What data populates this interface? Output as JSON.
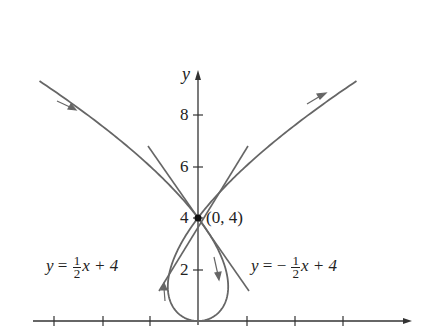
{
  "figure": {
    "axes": {
      "x_label": "",
      "y_label": "y",
      "y_ticks": [
        "2",
        "4",
        "6",
        "8"
      ],
      "x_tick_count_left": 3,
      "x_tick_count_right": 3
    },
    "point_label": "(0, 4)",
    "tangent_left": {
      "lhs": "y",
      "eq": "=",
      "num": "1",
      "den": "2",
      "rest": "x + 4"
    },
    "tangent_right": {
      "lhs": "y",
      "eq": "= −",
      "num": "1",
      "den": "2",
      "rest": "x + 4"
    },
    "colors": {
      "curve": "#666666",
      "axis": "#333333",
      "point": "#111111"
    },
    "curve": {
      "param_x": "t^3 - 4t",
      "param_y": "t^2",
      "t_range": [
        -3.05,
        3.05
      ]
    }
  }
}
